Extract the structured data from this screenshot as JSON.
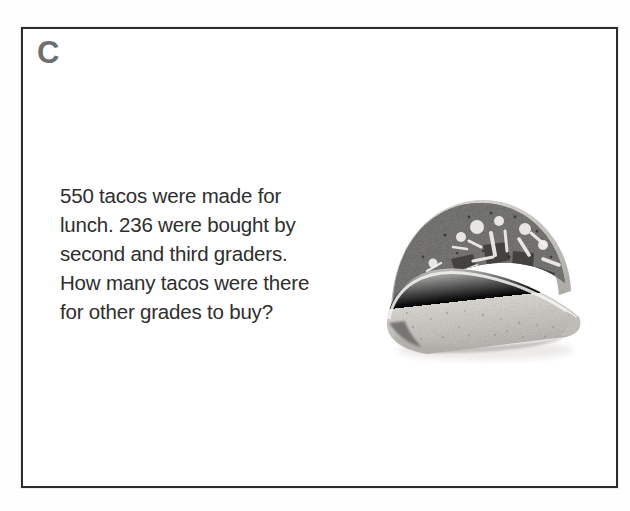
{
  "card": {
    "label": "C",
    "question": "550 tacos were made for\nlunch. 236 were bought by\nsecond and third graders.\nHow many tacos were there\nfor other grades to buy?",
    "question_lines": [
      "550 tacos were made for",
      "lunch. 236 were bought by",
      "second and third graders.",
      "How many tacos were there",
      "for other grades to buy?"
    ],
    "numbers": {
      "tacos_made": 550,
      "tacos_bought": 236
    },
    "border_color": "#2c2c2c",
    "label_color": "#6f6f6f",
    "text_color": "#2e2e2e",
    "background_color": "#ffffff"
  },
  "illustration": {
    "name": "taco-photo",
    "alt": "Grayscale photograph of a hard-shell taco filled with seasoned meat, shredded cheese and lettuce",
    "palette": {
      "shell_light": "#e6e4e0",
      "shell_mid": "#cfcdc8",
      "shell_shadow": "#a8a6a1",
      "filling_dark": "#4a4a48",
      "filling_mid": "#7c7b78",
      "filling_light": "#d9d7d2",
      "speckle": "#8d8b86",
      "ground_shadow": "#efeeec"
    }
  }
}
